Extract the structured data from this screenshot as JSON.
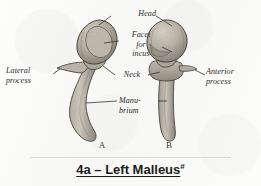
{
  "figure": {
    "caption_text": "4a – Left Malleus",
    "caption_mark": "#",
    "specimen_a_letter": "A",
    "specimen_b_letter": "B"
  },
  "labels": {
    "head": "Head",
    "facet_for_incus": "Facet\nfor\nincus",
    "lateral_process": "Lateral\nprocess",
    "neck": "Neck",
    "anterior_process": "Anterior\nprocess",
    "manubrium": "Manu-\nbrium"
  },
  "colors": {
    "paper": "#fbfbfa",
    "ink": "#2a2a2a",
    "bone_light": "#cdc7bd",
    "bone_mid": "#ada69a",
    "bone_dark": "#7d776c",
    "outline": "#4a453e",
    "leader": "#333333"
  }
}
